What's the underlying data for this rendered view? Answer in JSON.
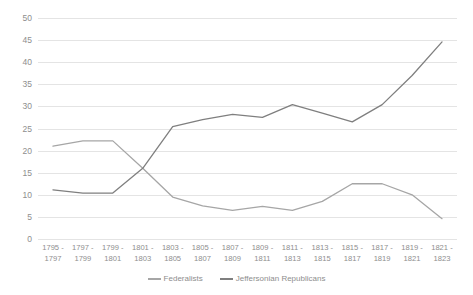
{
  "chart_data": {
    "type": "line",
    "title": "",
    "xlabel": "",
    "ylabel": "",
    "ylim": [
      0,
      50
    ],
    "yticks": [
      0,
      5,
      10,
      15,
      20,
      25,
      30,
      35,
      40,
      45,
      50
    ],
    "grid": true,
    "legend_position": "bottom",
    "categories": [
      {
        "l1": "1795 -",
        "l2": "1797"
      },
      {
        "l1": "1797 -",
        "l2": "1799"
      },
      {
        "l1": "1799 -",
        "l2": "1801"
      },
      {
        "l1": "1801 -",
        "l2": "1803"
      },
      {
        "l1": "1803 -",
        "l2": "1805"
      },
      {
        "l1": "1805 -",
        "l2": "1807"
      },
      {
        "l1": "1807 -",
        "l2": "1809"
      },
      {
        "l1": "1809 -",
        "l2": "1811"
      },
      {
        "l1": "1811 -",
        "l2": "1813"
      },
      {
        "l1": "1813 -",
        "l2": "1815"
      },
      {
        "l1": "1815 -",
        "l2": "1817"
      },
      {
        "l1": "1817 -",
        "l2": "1819"
      },
      {
        "l1": "1819 -",
        "l2": "1821"
      },
      {
        "l1": "1821 -",
        "l2": "1823"
      }
    ],
    "series": [
      {
        "name": "Federalists",
        "color": "#a6a6a6",
        "values": [
          21.0,
          22.2,
          22.2,
          16.0,
          9.5,
          7.5,
          6.5,
          7.4,
          6.5,
          8.5,
          12.5,
          12.5,
          10.0,
          4.6
        ]
      },
      {
        "name": "Jeffersonian Republicans",
        "color": "#7f7f7f",
        "values": [
          11.1,
          10.4,
          10.4,
          16.0,
          25.4,
          27.0,
          28.2,
          27.5,
          30.4,
          28.5,
          26.5,
          30.4,
          37.0,
          44.6
        ]
      }
    ]
  }
}
